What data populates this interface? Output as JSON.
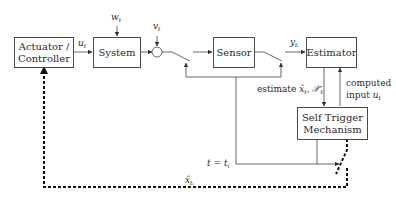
{
  "diagram": {
    "blocks": {
      "actuator": {
        "label_line1": "Actuator /",
        "label_line2": "Controller"
      },
      "system": {
        "label": "System"
      },
      "sensor": {
        "label": "Sensor"
      },
      "estimator": {
        "label": "Estimator"
      },
      "self_trigger": {
        "label_line1": "Self Trigger",
        "label_line2": "Mechanism"
      }
    },
    "signals": {
      "control_input": {
        "base": "u",
        "sub": "t"
      },
      "process_noise": {
        "base": "w",
        "sub": "t"
      },
      "measurement_noise": {
        "base": "v",
        "sub": "t"
      },
      "sampled_output": {
        "base": "y",
        "sub": "tᵢ"
      },
      "estimate": {
        "prefix": "estimate ",
        "value": "x̂",
        "sub": "t",
        "extra": ", 𝒳̃",
        "extra_sub": "t"
      },
      "computed_input_line1": "computed",
      "computed_input_line2": "input ",
      "computed_input_var": {
        "base": "u",
        "sub": "t"
      },
      "trigger_time": {
        "text": "t = t",
        "sub": "i"
      },
      "sent_estimate": {
        "base": "x̂",
        "sub": "tᵢ"
      }
    }
  }
}
